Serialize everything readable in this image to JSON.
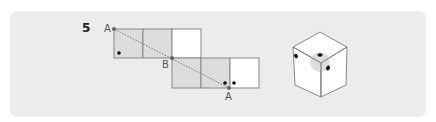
{
  "question": {
    "number": "5"
  },
  "net": {
    "labels": {
      "a_top": "A",
      "b_mid": "B",
      "a_bottom": "A"
    },
    "cells": [
      {
        "row": 1,
        "col": 1,
        "fill": "#dcdcdc",
        "dots": 1
      },
      {
        "row": 1,
        "col": 2,
        "fill": "#dcdcdc",
        "dots": 0
      },
      {
        "row": 1,
        "col": 3,
        "fill": "#ffffff",
        "dots": 0
      },
      {
        "row": 2,
        "col": 3,
        "fill": "#dcdcdc",
        "dots": 0
      },
      {
        "row": 2,
        "col": 4,
        "fill": "#dcdcdc",
        "dots": 1
      },
      {
        "row": 2,
        "col": 5,
        "fill": "#ffffff",
        "dots": 1
      }
    ],
    "dashed_line": "A to B to A"
  },
  "cube": {
    "visible_faces": 3,
    "dots_visible": 3,
    "highlight": "gray circle at top-front vertex"
  },
  "colors": {
    "panel_bg": "#ececec",
    "shaded_cell": "#dcdcdc",
    "line": "#888888",
    "dot": "#111111"
  }
}
